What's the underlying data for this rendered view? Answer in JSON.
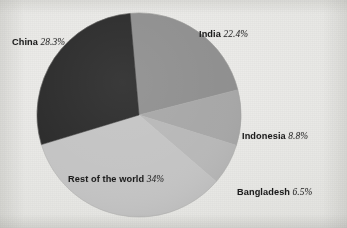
{
  "figure": {
    "background_color": "#e9e9e7",
    "text_color": "#1c1c1c"
  },
  "chart_data": {
    "type": "pie",
    "title": "",
    "subtitle": "",
    "xlabel": "",
    "ylabel": "",
    "legend_position": "none",
    "grid": false,
    "unit": "%",
    "total": 100,
    "start_angle_deg": -5,
    "direction": "clockwise",
    "center": {
      "x": 139,
      "y": 115
    },
    "radius": 102,
    "categories": [
      "India",
      "Indonesia",
      "Bangladesh",
      "Rest of the world",
      "China"
    ],
    "values": [
      22.4,
      8.8,
      6.5,
      34,
      28.3
    ],
    "colors": [
      "#8e8e8e",
      "#a6a6a6",
      "#b7b7b7",
      "#c3c3c3",
      "#2b2b2b"
    ],
    "slices": [
      {
        "name": "India",
        "value": 22.4,
        "value_label": "22.4%",
        "color": "#8e8e8e",
        "label_text": "India",
        "label_position": "outside-top-right"
      },
      {
        "name": "Indonesia",
        "value": 8.8,
        "value_label": "8.8%",
        "color": "#a6a6a6",
        "label_text": "Indonesia",
        "label_position": "outside-right"
      },
      {
        "name": "Bangladesh",
        "value": 6.5,
        "value_label": "6.5%",
        "color": "#b7b7b7",
        "label_text": "Bangladesh",
        "label_position": "outside-bottom-right"
      },
      {
        "name": "Rest of the world",
        "value": 34,
        "value_label": "34%",
        "color": "#c3c3c3",
        "label_text": "Rest of the world",
        "label_position": "inside-bottom-left"
      },
      {
        "name": "China",
        "value": 28.3,
        "value_label": "28.3%",
        "color": "#2b2b2b",
        "label_text": "China",
        "label_position": "outside-top-left"
      }
    ]
  },
  "labels": {
    "china": {
      "name": "China",
      "pct": "28.3%"
    },
    "india": {
      "name": "India",
      "pct": "22.4%"
    },
    "indonesia": {
      "name": "Indonesia",
      "pct": "8.8%"
    },
    "bangladesh": {
      "name": "Bangladesh",
      "pct": "6.5%"
    },
    "rest": {
      "name": "Rest of the world",
      "pct": "34%"
    }
  }
}
